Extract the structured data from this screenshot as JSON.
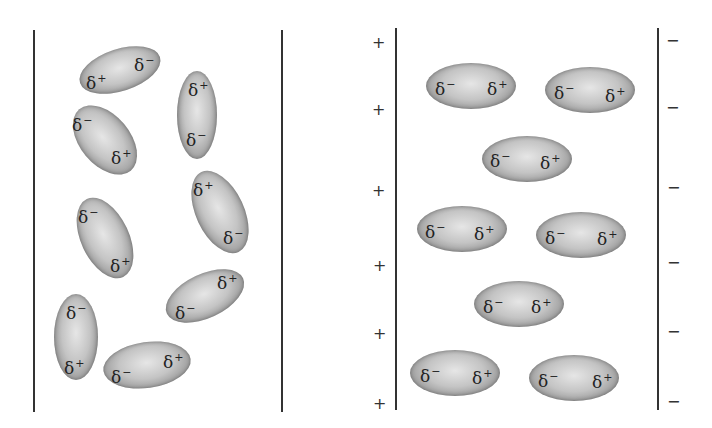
{
  "left_panel": {
    "description": "Randomly oriented polar molecules, no field",
    "molecules": [
      {
        "cx": 120,
        "cy": 70,
        "w": 84,
        "h": 42,
        "rot": -18,
        "labels": [
          {
            "text": "δ",
            "charge": "+",
            "x": 86,
            "y": 73
          },
          {
            "text": "δ",
            "charge": "−",
            "x": 134,
            "y": 55
          }
        ]
      },
      {
        "cx": 197,
        "cy": 115,
        "w": 40,
        "h": 88,
        "rot": 0,
        "labels": [
          {
            "text": "δ",
            "charge": "+",
            "x": 188,
            "y": 80
          },
          {
            "text": "δ",
            "charge": "−",
            "x": 186,
            "y": 130
          }
        ]
      },
      {
        "cx": 105,
        "cy": 140,
        "w": 50,
        "h": 80,
        "rot": -40,
        "labels": [
          {
            "text": "δ",
            "charge": "−",
            "x": 72,
            "y": 115
          },
          {
            "text": "δ",
            "charge": "+",
            "x": 111,
            "y": 148
          }
        ]
      },
      {
        "cx": 220,
        "cy": 212,
        "w": 48,
        "h": 88,
        "rot": -25,
        "labels": [
          {
            "text": "δ",
            "charge": "+",
            "x": 193,
            "y": 180
          },
          {
            "text": "δ",
            "charge": "−",
            "x": 223,
            "y": 228
          }
        ]
      },
      {
        "cx": 105,
        "cy": 238,
        "w": 48,
        "h": 86,
        "rot": -25,
        "labels": [
          {
            "text": "δ",
            "charge": "−",
            "x": 78,
            "y": 207
          },
          {
            "text": "δ",
            "charge": "+",
            "x": 110,
            "y": 256
          }
        ]
      },
      {
        "cx": 205,
        "cy": 296,
        "w": 84,
        "h": 44,
        "rot": -25,
        "labels": [
          {
            "text": "δ",
            "charge": "+",
            "x": 217,
            "y": 273
          },
          {
            "text": "δ",
            "charge": "−",
            "x": 175,
            "y": 303
          }
        ]
      },
      {
        "cx": 76,
        "cy": 337,
        "w": 44,
        "h": 86,
        "rot": 0,
        "labels": [
          {
            "text": "δ",
            "charge": "−",
            "x": 66,
            "y": 303
          },
          {
            "text": "δ",
            "charge": "+",
            "x": 64,
            "y": 358
          }
        ]
      },
      {
        "cx": 147,
        "cy": 365,
        "w": 88,
        "h": 46,
        "rot": -8,
        "labels": [
          {
            "text": "δ",
            "charge": "−",
            "x": 111,
            "y": 367
          },
          {
            "text": "δ",
            "charge": "+",
            "x": 163,
            "y": 352
          }
        ]
      }
    ]
  },
  "right_panel": {
    "description": "Polar molecules aligned in electric field between charged plates",
    "positive_plate_signs": [
      {
        "text": "+",
        "x": 372,
        "y": 35
      },
      {
        "text": "+",
        "x": 372,
        "y": 102
      },
      {
        "text": "+",
        "x": 372,
        "y": 183
      },
      {
        "text": "+",
        "x": 373,
        "y": 258
      },
      {
        "text": "+",
        "x": 373,
        "y": 326
      },
      {
        "text": "+",
        "x": 373,
        "y": 396
      }
    ],
    "negative_plate_signs": [
      {
        "text": "−",
        "x": 666,
        "y": 33
      },
      {
        "text": "−",
        "x": 666,
        "y": 100
      },
      {
        "text": "−",
        "x": 667,
        "y": 180
      },
      {
        "text": "−",
        "x": 667,
        "y": 255
      },
      {
        "text": "−",
        "x": 667,
        "y": 324
      },
      {
        "text": "−",
        "x": 667,
        "y": 394
      }
    ],
    "molecules": [
      {
        "cx": 471,
        "cy": 86,
        "w": 90,
        "h": 46,
        "rot": 0,
        "labels": [
          {
            "text": "δ",
            "charge": "−",
            "x": 435,
            "y": 79
          },
          {
            "text": "δ",
            "charge": "+",
            "x": 487,
            "y": 79
          }
        ]
      },
      {
        "cx": 590,
        "cy": 90,
        "w": 90,
        "h": 46,
        "rot": 0,
        "labels": [
          {
            "text": "δ",
            "charge": "−",
            "x": 554,
            "y": 83
          },
          {
            "text": "δ",
            "charge": "+",
            "x": 605,
            "y": 86
          }
        ]
      },
      {
        "cx": 527,
        "cy": 159,
        "w": 90,
        "h": 46,
        "rot": 0,
        "labels": [
          {
            "text": "δ",
            "charge": "−",
            "x": 490,
            "y": 151
          },
          {
            "text": "δ",
            "charge": "+",
            "x": 540,
            "y": 153
          }
        ]
      },
      {
        "cx": 462,
        "cy": 229,
        "w": 90,
        "h": 46,
        "rot": 0,
        "labels": [
          {
            "text": "δ",
            "charge": "−",
            "x": 425,
            "y": 222
          },
          {
            "text": "δ",
            "charge": "+",
            "x": 474,
            "y": 224
          }
        ]
      },
      {
        "cx": 581,
        "cy": 235,
        "w": 90,
        "h": 46,
        "rot": 0,
        "labels": [
          {
            "text": "δ",
            "charge": "−",
            "x": 545,
            "y": 228
          },
          {
            "text": "δ",
            "charge": "+",
            "x": 597,
            "y": 229
          }
        ]
      },
      {
        "cx": 519,
        "cy": 304,
        "w": 90,
        "h": 46,
        "rot": 0,
        "labels": [
          {
            "text": "δ",
            "charge": "−",
            "x": 483,
            "y": 297
          },
          {
            "text": "δ",
            "charge": "+",
            "x": 531,
            "y": 297
          }
        ]
      },
      {
        "cx": 455,
        "cy": 373,
        "w": 90,
        "h": 46,
        "rot": 0,
        "labels": [
          {
            "text": "δ",
            "charge": "−",
            "x": 420,
            "y": 366
          },
          {
            "text": "δ",
            "charge": "+",
            "x": 472,
            "y": 368
          }
        ]
      },
      {
        "cx": 574,
        "cy": 378,
        "w": 90,
        "h": 46,
        "rot": 0,
        "labels": [
          {
            "text": "δ",
            "charge": "−",
            "x": 538,
            "y": 371
          },
          {
            "text": "δ",
            "charge": "+",
            "x": 592,
            "y": 372
          }
        ]
      }
    ]
  }
}
